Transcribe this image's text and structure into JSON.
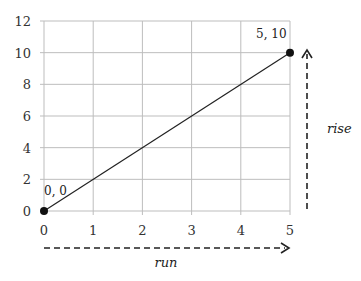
{
  "chart_data": {
    "type": "line",
    "title": "",
    "xlabel": "run",
    "ylabel": "rise",
    "xlim": [
      0,
      5
    ],
    "ylim": [
      0,
      12
    ],
    "x_ticks": [
      "0",
      "1",
      "2",
      "3",
      "4",
      "5"
    ],
    "y_ticks": [
      "0",
      "2",
      "4",
      "6",
      "8",
      "10",
      "12"
    ],
    "grid": true,
    "series": [
      {
        "name": "line",
        "x": [
          0,
          5
        ],
        "y": [
          0,
          10
        ]
      }
    ],
    "points": [
      {
        "x": 0,
        "y": 0,
        "label": "0, 0"
      },
      {
        "x": 5,
        "y": 10,
        "label": "5, 10"
      }
    ],
    "annotations": [
      {
        "text": "run",
        "type": "dashed-arrow-horizontal"
      },
      {
        "text": "rise",
        "type": "dashed-arrow-vertical"
      }
    ]
  },
  "labels": {
    "origin": "0, 0",
    "end": "5, 10",
    "run": "run",
    "rise": "rise"
  }
}
